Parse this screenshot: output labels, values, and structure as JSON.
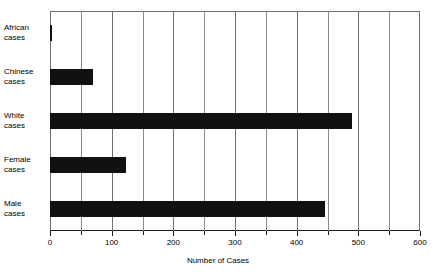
{
  "chart_data": {
    "type": "bar",
    "orientation": "horizontal",
    "title": "",
    "xlabel": "Number of Cases",
    "ylabel": "",
    "categories": [
      "African cases",
      "Chinese cases",
      "White cases",
      "Female cases",
      "Male cases"
    ],
    "category_lines": [
      [
        "African",
        "cases"
      ],
      [
        "Chinese",
        "cases"
      ],
      [
        "White",
        "cases"
      ],
      [
        "Female",
        "cases"
      ],
      [
        "Male",
        "cases"
      ]
    ],
    "values": [
      4,
      70,
      490,
      123,
      446
    ],
    "xlim": [
      0,
      600
    ],
    "xticks": [
      0,
      100,
      200,
      300,
      400,
      500,
      600
    ],
    "xtick_labels": [
      "0",
      "100",
      "200",
      "300",
      "400",
      "500",
      "600"
    ],
    "minor_xticks": [
      50,
      150,
      250,
      350,
      450,
      550
    ],
    "grid": "vertical-only",
    "legend": "none",
    "bar_color": "#111111",
    "grid_color": "#8a8a8a",
    "axis_color": "#1a1a1a",
    "background": "#ffffff"
  }
}
